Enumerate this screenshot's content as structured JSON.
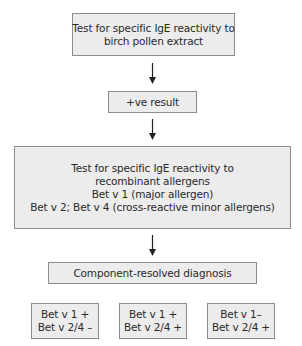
{
  "diagram": {
    "type": "flowchart",
    "colors": {
      "box_fill": "#ececec",
      "box_border": "#8c8c8c",
      "arrow": "#222222",
      "text": "#2a2a2a"
    },
    "nodes": {
      "initial_test": {
        "lines": [
          "Test for specific IgE reactivity to",
          "birch pollen extract"
        ]
      },
      "positive_result": {
        "lines": [
          "+ve result"
        ]
      },
      "recombinant_test": {
        "lines": [
          "Test for specific IgE reactivity to",
          "recombinant allergens",
          "Bet v 1 (major allergen)",
          "Bet v 2; Bet v 4 (cross-reactive minor allergens)"
        ]
      },
      "crd": {
        "lines": [
          "Component-resolved diagnosis"
        ]
      },
      "outcomes": [
        {
          "lines": [
            "Bet v 1 +",
            "Bet v 2/4 –"
          ]
        },
        {
          "lines": [
            "Bet v 1 +",
            "Bet v 2/4 +"
          ]
        },
        {
          "lines": [
            "Bet v 1–",
            "Bet v 2/4 +"
          ]
        }
      ]
    },
    "edges": [
      {
        "from": "initial_test",
        "to": "positive_result"
      },
      {
        "from": "positive_result",
        "to": "recombinant_test"
      },
      {
        "from": "recombinant_test",
        "to": "crd"
      }
    ]
  }
}
